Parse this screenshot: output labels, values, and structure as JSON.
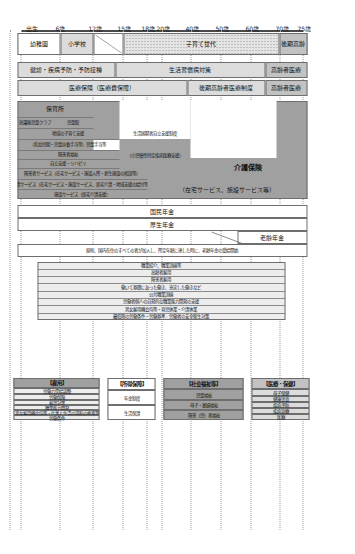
{
  "diagram": {
    "axis": {
      "name": "年齢",
      "ticks": [
        {
          "label": "出生",
          "value": 0
        },
        {
          "label": "6歳",
          "value": 6
        },
        {
          "label": "12歳",
          "value": 12
        },
        {
          "label": "15歳",
          "value": 15
        },
        {
          "label": "18歳",
          "value": 18
        },
        {
          "label": "20歳",
          "value": 20
        },
        {
          "label": "40歳",
          "value": 40
        },
        {
          "label": "50歳",
          "value": 50
        },
        {
          "label": "60歳",
          "value": 60
        },
        {
          "label": "70歳",
          "value": 70
        },
        {
          "label": "75歳",
          "value": 75
        }
      ]
    },
    "columns": [
      {
        "key": "education",
        "bands": [
          {
            "id": "kindergarten",
            "label": "幼稚園",
            "fill": "white"
          },
          {
            "id": "elementary",
            "label": "小学校",
            "fill": "light"
          },
          {
            "id": "childcare_gap",
            "label": "",
            "fill": "white"
          },
          {
            "id": "childrearing",
            "label": "子育て世代",
            "fill": "hatch"
          },
          {
            "id": "late_elderly",
            "label": "後期高齢",
            "fill": "mid"
          }
        ]
      },
      {
        "key": "health",
        "bands": [
          {
            "id": "prenatal",
            "label": "妊娠・出産・育児",
            "fill": "mid"
          },
          {
            "id": "checkup",
            "label": "健診・疾病予防・予防接種",
            "fill": "light"
          },
          {
            "id": "lifestyle",
            "label": "生活習慣病対策",
            "fill": "light"
          },
          {
            "id": "elderly_med",
            "label": "高齢者医療",
            "fill": "mid"
          }
        ]
      },
      {
        "key": "medical_insurance",
        "bands": [
          {
            "id": "med_ins_main",
            "label": "医療保険（医療費保障）",
            "fill": "light"
          },
          {
            "id": "med_ins_old",
            "label": "後期高齢者医療制度",
            "fill": "light"
          },
          {
            "id": "med_ins_tail",
            "label": "高齢者医療",
            "fill": "mid"
          }
        ]
      },
      {
        "key": "welfare",
        "bands": [
          {
            "id": "nursery",
            "label": "保育所",
            "fill": "dark"
          },
          {
            "id": "jidokan",
            "label": "児童館",
            "fill": "dark"
          },
          {
            "id": "afterschool",
            "label": "放課後児童クラブ",
            "fill": "dark"
          },
          {
            "id": "region_child",
            "label": "地域の子育て支援",
            "fill": "dark"
          },
          {
            "id": "child_allowance",
            "label": "（乳幼児期・児童扶養手当等）児童手当等",
            "fill": "dark"
          },
          {
            "id": "handicap",
            "label": "障害者福祉",
            "fill": "dark"
          },
          {
            "id": "rehab",
            "label": "自立支援・リハビリ",
            "fill": "dark"
          },
          {
            "id": "svc_disabled",
            "label": "障害者サービス（在宅サービス・施設入所・更生施設の相談等）",
            "fill": "dark"
          },
          {
            "id": "svc_home",
            "label": "介護サービス（在宅サービス・施設サービス、居宅介護・地域支援の給付等）",
            "fill": "dark"
          },
          {
            "id": "support_facility",
            "label": "施設サービス（居宅介護支援）",
            "fill": "dark"
          },
          {
            "id": "life_support",
            "label": "生活困窮者自立支援制度",
            "fill": "dark"
          },
          {
            "id": "child_welfare_law",
            "label": "（小児慢性特定疾病医療支援）",
            "fill": "dark"
          },
          {
            "id": "ltci",
            "label": "介護保険",
            "fill": "dark"
          },
          {
            "id": "ltci_sub",
            "label": "（在宅サービス、施設サービス等）",
            "fill": "dark"
          }
        ]
      },
      {
        "key": "pension",
        "bands": [
          {
            "id": "basic_pension",
            "label": "国民年金",
            "fill": "white"
          },
          {
            "id": "employee_pension",
            "label": "厚生年金",
            "fill": "white"
          },
          {
            "id": "old_age_pension",
            "label": "老齢年金",
            "fill": "white"
          },
          {
            "id": "pension_note",
            "label": "原則、国内在住のすべての者が加入し、所定年齢に達した時に、老齢年金の受給開始",
            "fill": "white"
          }
        ]
      },
      {
        "key": "labour",
        "bands": [
          {
            "id": "job_placement",
            "label": "職業紹介、職業訓練等",
            "fill": "pale"
          },
          {
            "id": "elderly_employment",
            "label": "高齢者雇用",
            "fill": "pale"
          },
          {
            "id": "disabled_employment",
            "label": "障害者雇用",
            "fill": "pale"
          },
          {
            "id": "work_life_balance",
            "label": "働いて基礎にあった働き、充実した働きなど",
            "fill": "pale"
          },
          {
            "id": "public_employment",
            "label": "公共職業訓練",
            "fill": "pale"
          },
          {
            "id": "foreign_worker",
            "label": "労働者個人の自発的な職業能力開発の支援",
            "fill": "pale"
          },
          {
            "id": "equal_treat",
            "label": "男女雇用機会均等・育児休業・介護休業",
            "fill": "pale"
          },
          {
            "id": "safety_health",
            "label": "最低限の労働条件・労働基準／労働者の安全衛生対策",
            "fill": "pale"
          }
        ]
      }
    ],
    "legends": [
      {
        "key": "medical",
        "title": "【医療・保健】",
        "fill": "mid",
        "items": [
          {
            "label": "母子保健",
            "fill": "light"
          },
          {
            "label": "健康診査",
            "fill": "light"
          },
          {
            "label": "疾病予防",
            "fill": "light"
          },
          {
            "label": "疾病治療",
            "fill": "light"
          },
          {
            "label": "医療",
            "fill": "light"
          }
        ]
      },
      {
        "key": "welfare",
        "title": "【社会福祉等】",
        "fill": "dark",
        "items": [
          {
            "label": "児童福祉",
            "fill": "dark"
          },
          {
            "label": "母子・寡婦福祉",
            "fill": "dark"
          },
          {
            "label": "障害（児）者福祉",
            "fill": "dark"
          }
        ]
      },
      {
        "key": "pension",
        "title": "【所得保障】",
        "fill": "white",
        "items": [
          {
            "label": "年金制度",
            "fill": "white"
          },
          {
            "label": "生活保護",
            "fill": "white"
          }
        ]
      },
      {
        "key": "labour",
        "title": "【雇用】",
        "fill": "pale",
        "items": [
          {
            "label": "労働力需給調整",
            "fill": "pale"
          },
          {
            "label": "労働保険",
            "fill": "pale"
          },
          {
            "label": "雇用対策",
            "fill": "pale"
          },
          {
            "label": "職業能力開発",
            "fill": "pale"
          },
          {
            "label": "男女雇用機会均等・仕事と生活の調和の推進等",
            "fill": "pale"
          },
          {
            "label": "労働条件",
            "fill": "pale"
          }
        ]
      }
    ],
    "colors": {
      "dark": "#a0a0a0",
      "mid": "#c2c2c2",
      "light": "#dcdcdc",
      "pale": "#ededed",
      "white": "#ffffff",
      "border": "#6e6e6e",
      "grid": "#9b9b9b"
    }
  }
}
